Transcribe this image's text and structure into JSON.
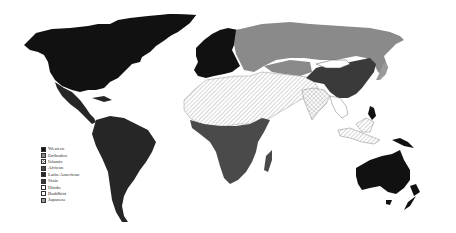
{
  "map": {
    "title": "",
    "type": "world civilizations choropleth"
  },
  "legend": {
    "items": [
      {
        "label": "Western",
        "color": "#111111",
        "pattern": "solid"
      },
      {
        "label": "Orthodox",
        "color": "#8a8a8a",
        "pattern": "solid"
      },
      {
        "label": "Islamic",
        "color": "#ffffff",
        "pattern": "hatch"
      },
      {
        "label": "African",
        "color": "#4a4a4a",
        "pattern": "solid"
      },
      {
        "label": "Latin American",
        "color": "#262626",
        "pattern": "solid"
      },
      {
        "label": "Sinic",
        "color": "#3a3a3a",
        "pattern": "solid"
      },
      {
        "label": "Hindu",
        "color": "#ffffff",
        "pattern": "crosshatch"
      },
      {
        "label": "Buddhist",
        "color": "#ffffff",
        "pattern": "none"
      },
      {
        "label": "Japanese",
        "color": "#9a9a9a",
        "pattern": "dots"
      }
    ]
  }
}
